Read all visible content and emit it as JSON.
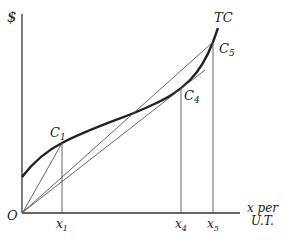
{
  "diagram": {
    "type": "economics-cost-curve",
    "y_axis_label": "$",
    "x_axis_label_line1": "x per",
    "x_axis_label_line2": "U.T.",
    "origin_label": "O",
    "curve_label": "TC",
    "points": [
      {
        "name": "C",
        "sub": "1",
        "x_label": "x",
        "x_sub": "1"
      },
      {
        "name": "C",
        "sub": "4",
        "x_label": "x",
        "x_sub": "4"
      },
      {
        "name": "C",
        "sub": "5",
        "x_label": "x",
        "x_sub": "5"
      }
    ],
    "rays_from_origin": [
      "to C1",
      "tangent at C4",
      "to C5"
    ]
  }
}
